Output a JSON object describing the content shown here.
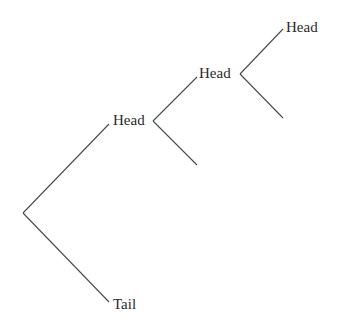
{
  "diagram": {
    "type": "probability-tree",
    "nodes": [
      {
        "id": "root",
        "x": 23,
        "y": 213,
        "label": ""
      },
      {
        "id": "h1",
        "label": "Head"
      },
      {
        "id": "t1",
        "label": "Tail"
      },
      {
        "id": "h2",
        "label": "Head"
      },
      {
        "id": "h3",
        "label": "Head"
      }
    ],
    "labels": {
      "level1_upper": "Head",
      "level1_lower": "Tail",
      "level2_upper": "Head",
      "level3_upper": "Head"
    },
    "colors": {
      "line": "#4a4a4a",
      "text": "#2a2a2a",
      "background": "#ffffff"
    }
  }
}
